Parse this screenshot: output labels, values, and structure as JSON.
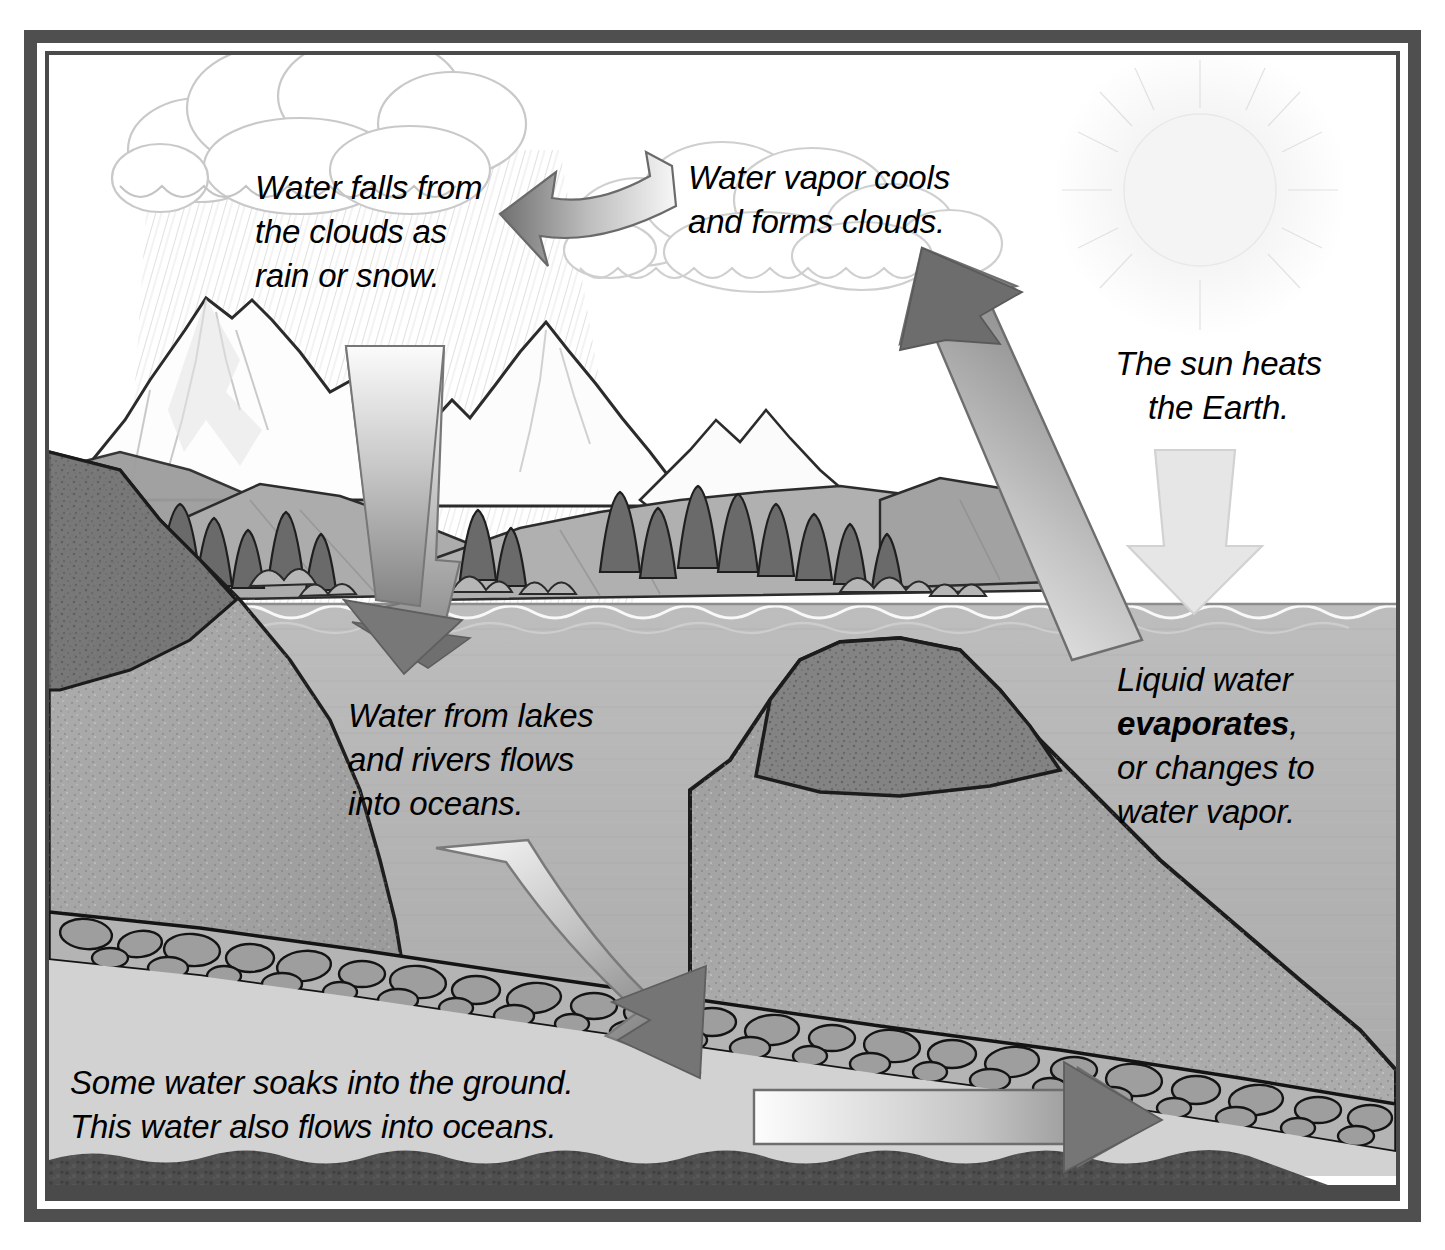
{
  "diagram": {
    "style": "grayscale pencil illustration with double border frame",
    "labels": {
      "precipitation": "Water falls from\nthe clouds as\nrain or snow.",
      "condensation": "Water vapor cools\nand forms clouds.",
      "sun": "The sun heats\nthe Earth.",
      "evaporation_line1": "Liquid water",
      "evaporation_keyword": "evaporates",
      "evaporation_line2": ",",
      "evaporation_line3": "or changes to\nwater vapor.",
      "runoff": "Water from lakes\nand rivers flows\ninto oceans.",
      "groundwater": "Some water soaks into the ground.\nThis water also flows into oceans."
    },
    "arrows": [
      {
        "name": "condensation-arrow",
        "direction": "curved-left",
        "from": "water vapor rising",
        "to": "clouds",
        "shading": "light-to-dark"
      },
      {
        "name": "precipitation-arrow",
        "direction": "down",
        "from": "clouds",
        "to": "lake",
        "shading": "light-to-dark"
      },
      {
        "name": "evaporation-arrow",
        "direction": "up-left",
        "from": "ocean surface",
        "to": "clouds",
        "shading": "light-to-dark"
      },
      {
        "name": "sun-heat-arrow",
        "direction": "down",
        "from": "sun",
        "to": "ocean surface",
        "shading": "very-light"
      },
      {
        "name": "infiltration-arrow",
        "direction": "curved-down-right",
        "from": "lake floor",
        "to": "gravel aquifer",
        "shading": "light-to-dark"
      },
      {
        "name": "groundwater-flow-arrow",
        "direction": "right",
        "from": "aquifer",
        "to": "ocean",
        "shading": "light-to-dark"
      }
    ],
    "scene_elements": [
      {
        "name": "sun",
        "description": "faint pale disc with radial glow and rays"
      },
      {
        "name": "clouds",
        "description": "white cumulus clouds with gray outlines"
      },
      {
        "name": "rain-hatching",
        "description": "diagonal pencil lines falling from clouds"
      },
      {
        "name": "snow-capped-mountains",
        "description": "white peaks with shaded slopes"
      },
      {
        "name": "hills",
        "description": "gray rolling hills"
      },
      {
        "name": "conifer-trees",
        "description": "dark evergreen trees along the shoreline"
      },
      {
        "name": "shrubs",
        "description": "rounded bushes near the water"
      },
      {
        "name": "ocean-water",
        "description": "mid-gray water body cross-section"
      },
      {
        "name": "water-surface-waves",
        "description": "wavy line at the waterline"
      },
      {
        "name": "left-rock-slope",
        "description": "speckled rock cliff on the left"
      },
      {
        "name": "underwater-mountain",
        "description": "submerged speckled rock mound"
      },
      {
        "name": "gravel-aquifer",
        "description": "layer of outlined cobbles and pebbles"
      },
      {
        "name": "bedrock",
        "description": "dark mottled band at the bottom"
      }
    ],
    "colors": {
      "frame": "#4f4f4f",
      "water": "#b3b3b3",
      "rock": "#a8a8a8",
      "bedrock": "#4a4a4a",
      "arrow_dark": "#6f6f6f",
      "arrow_light": "#f2f2f2",
      "text": "#000000"
    }
  }
}
